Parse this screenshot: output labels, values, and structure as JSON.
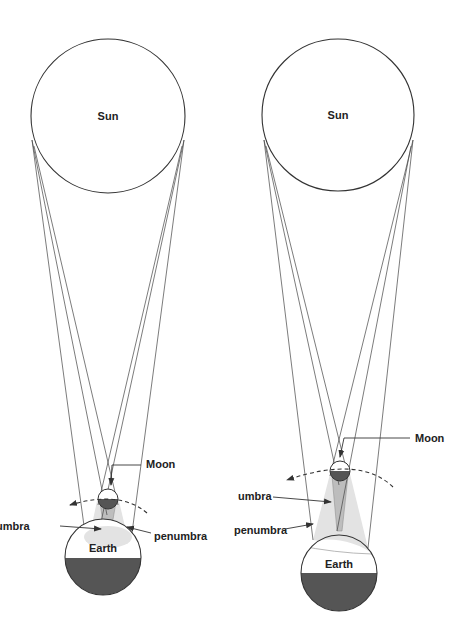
{
  "colors": {
    "outline": "#333333",
    "penumbra_fill": "#e3e3e3",
    "umbra_fill": "#bdbdbd",
    "dark_half": "#555555",
    "background": "#ffffff"
  },
  "panels": [
    {
      "id": "left",
      "labels": {
        "sun": "Sun",
        "moon": "Moon",
        "earth": "Earth",
        "umbra": "umbra",
        "penumbra": "penumbra"
      }
    },
    {
      "id": "right",
      "labels": {
        "sun": "Sun",
        "moon": "Moon",
        "earth": "Earth",
        "umbra": "umbra",
        "penumbra": "penumbra"
      }
    }
  ]
}
